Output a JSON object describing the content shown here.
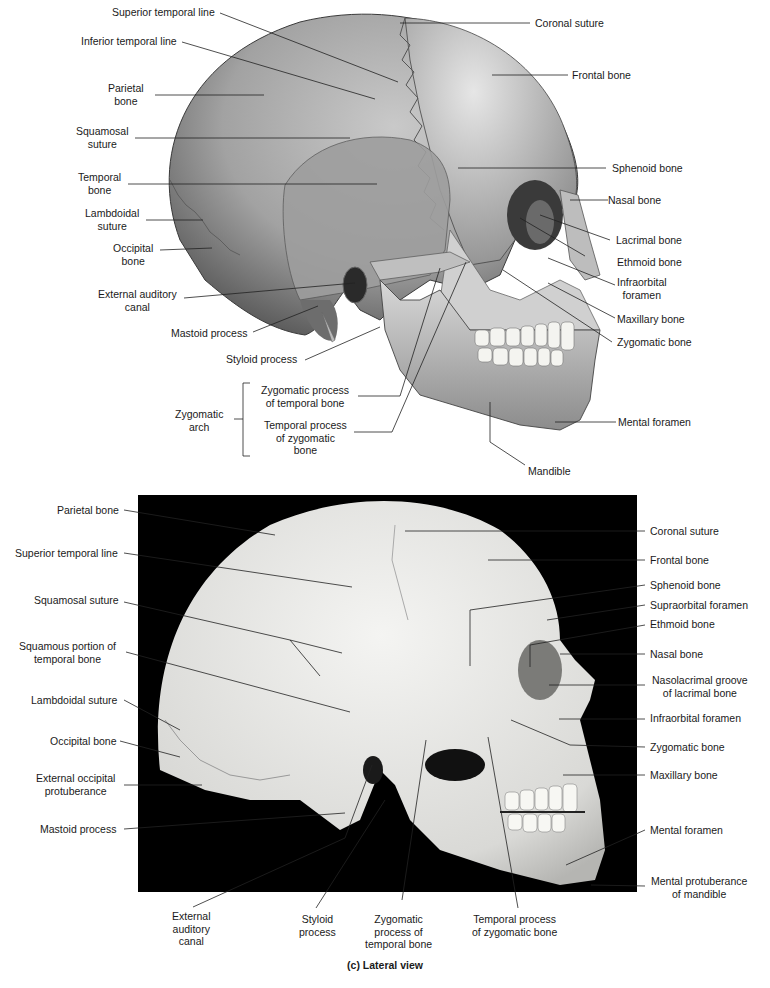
{
  "figure_top": {
    "labels_left": {
      "superior_temporal_line": "Superior temporal line",
      "inferior_temporal_line": "Inferior temporal line",
      "parietal_bone": [
        "Parietal",
        "bone"
      ],
      "squamosal_suture": [
        "Squamosal",
        "suture"
      ],
      "temporal_bone": [
        "Temporal",
        "bone"
      ],
      "lambdoidal_suture": [
        "Lambdoidal",
        "suture"
      ],
      "occipital_bone": [
        "Occipital",
        "bone"
      ],
      "external_auditory_canal": [
        "External auditory",
        "canal"
      ],
      "mastoid_process": "Mastoid process",
      "styloid_process": "Styloid process",
      "zygomatic_arch": [
        "Zygomatic",
        "arch"
      ],
      "zygomatic_process_of_temporal_bone": [
        "Zygomatic process",
        "of temporal bone"
      ],
      "temporal_process_of_zygomatic_bone": [
        "Temporal process",
        "of zygomatic",
        "bone"
      ]
    },
    "labels_right": {
      "coronal_suture": "Coronal suture",
      "frontal_bone": "Frontal bone",
      "sphenoid_bone": "Sphenoid bone",
      "nasal_bone": "Nasal bone",
      "lacrimal_bone": "Lacrimal bone",
      "ethmoid_bone": "Ethmoid bone",
      "infraorbital_foramen": [
        "Infraorbital",
        "foramen"
      ],
      "maxillary_bone": "Maxillary bone",
      "zygomatic_bone": "Zygomatic bone",
      "mental_foramen": "Mental foramen",
      "mandible": "Mandible"
    }
  },
  "figure_bottom": {
    "labels_left": {
      "parietal_bone": "Parietal bone",
      "superior_temporal_line": "Superior temporal line",
      "squamosal_suture": "Squamosal suture",
      "squamous_portion": [
        "Squamous portion of",
        "temporal bone"
      ],
      "lambdoidal_suture": "Lambdoidal suture",
      "occipital_bone": "Occipital bone",
      "external_occipital_protuberance": [
        "External occipital",
        "protuberance"
      ],
      "mastoid_process": "Mastoid process"
    },
    "labels_right": {
      "coronal_suture": "Coronal suture",
      "frontal_bone": "Frontal bone",
      "sphenoid_bone": "Sphenoid bone",
      "supraorbital_foramen": "Supraorbital foramen",
      "ethmoid_bone": "Ethmoid bone",
      "nasal_bone": "Nasal bone",
      "nasolacrimal_groove": [
        "Nasolacrimal groove",
        "of lacrimal bone"
      ],
      "infraorbital_foramen": "Infraorbital foramen",
      "zygomatic_bone": "Zygomatic bone",
      "maxillary_bone": "Maxillary bone",
      "mental_foramen": "Mental foramen",
      "mental_protuberance": [
        "Mental protuberance",
        "of mandible"
      ]
    },
    "labels_bottom": {
      "external_auditory_canal": [
        "External",
        "auditory",
        "canal"
      ],
      "styloid_process": [
        "Styloid",
        "process"
      ],
      "zygomatic_process_of_temporal_bone": [
        "Zygomatic",
        "process of",
        "temporal bone"
      ],
      "temporal_process_of_zygomatic_bone": [
        "Temporal process",
        "of zygomatic bone"
      ]
    }
  },
  "caption": "(c) Lateral view"
}
